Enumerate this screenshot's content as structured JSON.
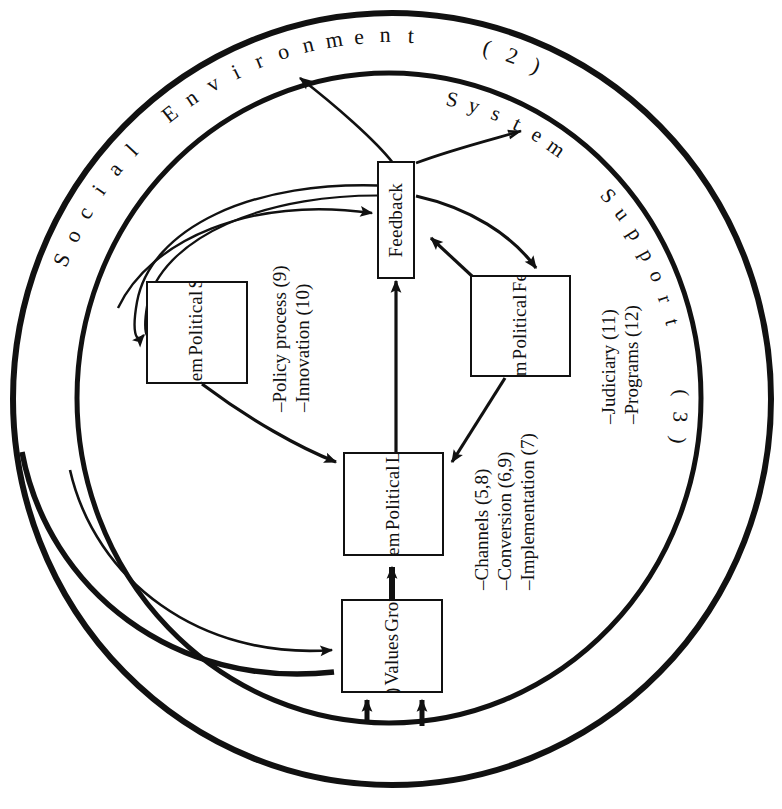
{
  "diagram": {
    "type": "systems-flow-diagram",
    "colors": {
      "stroke": "#111111",
      "fill": "#ffffff",
      "background": "#ffffff"
    },
    "rings": [
      {
        "name": "outer-ring",
        "label": "Social Environment  (2)",
        "label_short": "Social Environment",
        "number": "(2)"
      },
      {
        "name": "inner-ring",
        "label": "System  Support  (3)",
        "label_short": "System Support",
        "number": "(3)"
      }
    ],
    "ring_labels": {
      "outer": {
        "chars": [
          "S",
          "o",
          "c",
          "i",
          "a",
          "l",
          " ",
          "E",
          "n",
          "v",
          "i",
          "r",
          "o",
          "n",
          "m",
          "e",
          "n",
          "t",
          " ",
          " ",
          "(",
          "2",
          ")"
        ]
      },
      "inner": {
        "chars": [
          "S",
          "y",
          "s",
          "t",
          "e",
          "m",
          " ",
          " ",
          "S",
          "u",
          "p",
          "p",
          "o",
          "r",
          "t",
          " ",
          " ",
          "(",
          "3",
          ")"
        ]
      }
    },
    "boxes": [
      {
        "id": "feedback",
        "name": "feedback-box",
        "lines": [
          "Feedback"
        ]
      },
      {
        "id": "state",
        "name": "state-political-system-box",
        "lines": [
          "State",
          "Political",
          "System"
        ]
      },
      {
        "id": "federal",
        "name": "federal-political-system-box",
        "lines": [
          "Federal",
          "Political",
          "System"
        ]
      },
      {
        "id": "local",
        "name": "local-political-system-box",
        "lines": [
          "Local",
          "Political",
          "System"
        ]
      },
      {
        "id": "group",
        "name": "group-values-box",
        "lines": [
          "Group",
          "Values",
          "(4)"
        ]
      }
    ],
    "annotations": [
      {
        "id": "left-notes",
        "name": "policy-innovation-notes",
        "lines": [
          "–Policy process (9)",
          "–Innovation (10)"
        ]
      },
      {
        "id": "mid-notes",
        "name": "channels-conversion-implementation-notes",
        "lines": [
          "–Channels (5,8)",
          "–Conversion (6,9)",
          "–Implementation (7)"
        ]
      },
      {
        "id": "right-notes",
        "name": "judiciary-programs-notes",
        "lines": [
          "–Judiciary (11)",
          "–Programs (12)"
        ]
      }
    ],
    "numbered_items": [
      {
        "n": "2",
        "label": "Social Environment"
      },
      {
        "n": "3",
        "label": "System Support"
      },
      {
        "n": "4",
        "label": "Group Values"
      },
      {
        "n": "5,8",
        "label": "Channels"
      },
      {
        "n": "6,9",
        "label": "Conversion"
      },
      {
        "n": "7",
        "label": "Implementation"
      },
      {
        "n": "9",
        "label": "Policy process"
      },
      {
        "n": "10",
        "label": "Innovation"
      },
      {
        "n": "11",
        "label": "Judiciary"
      },
      {
        "n": "12",
        "label": "Programs"
      }
    ],
    "flows": [
      {
        "name": "feedback-to-social-environment",
        "from": "feedback",
        "to": "outer-ring"
      },
      {
        "name": "feedback-to-system-support",
        "from": "feedback",
        "to": "inner-ring"
      },
      {
        "name": "feedback-to-federal",
        "from": "feedback",
        "to": "federal"
      },
      {
        "name": "federal-to-feedback",
        "from": "federal",
        "to": "feedback"
      },
      {
        "name": "local-to-feedback",
        "from": "local",
        "to": "feedback"
      },
      {
        "name": "environment-to-feedback",
        "from": "outer-ring",
        "to": "feedback"
      },
      {
        "name": "environment-to-state",
        "from": "outer-ring",
        "to": "state"
      },
      {
        "name": "state-to-local",
        "from": "state",
        "to": "local"
      },
      {
        "name": "federal-to-local",
        "from": "federal",
        "to": "local"
      },
      {
        "name": "group-to-local",
        "from": "group",
        "to": "local"
      },
      {
        "name": "environment-to-group",
        "from": "outer-ring",
        "to": "group"
      },
      {
        "name": "support-to-group-left",
        "from": "inner-ring",
        "to": "group"
      },
      {
        "name": "support-to-group-right",
        "from": "inner-ring",
        "to": "group"
      }
    ]
  }
}
